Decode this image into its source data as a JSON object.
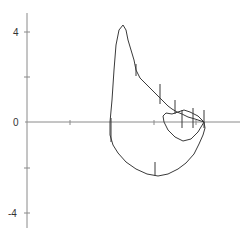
{
  "chart_data": {
    "type": "line",
    "title": "",
    "xlabel": "",
    "ylabel": "",
    "ylim": [
      -5,
      5
    ],
    "y_ticks": [
      4,
      2,
      0,
      -2,
      -4
    ],
    "y_tick_labels": [
      "4",
      "",
      "0",
      "",
      "-4"
    ],
    "x_ticks_visible": true,
    "x_tick_labels": [],
    "grid": false,
    "legend": null,
    "series": [
      {
        "name": "loop-trace",
        "description": "Closed hand-drawn loop: rises steeply to a peak near y=4.3, descends diagonally with small vertical tick marks toward the x-axis, forms a small inner loop just above the axis, then closes through a lower lobe reaching about y=-2.4.",
        "points_px": [
          [
            110,
            122
          ],
          [
            112,
            100
          ],
          [
            114,
            70
          ],
          [
            116,
            45
          ],
          [
            119,
            30
          ],
          [
            123,
            25
          ],
          [
            126,
            30
          ],
          [
            128,
            40
          ],
          [
            131,
            50
          ],
          [
            134,
            60
          ],
          [
            136,
            70
          ],
          [
            140,
            78
          ],
          [
            146,
            84
          ],
          [
            152,
            90
          ],
          [
            158,
            96
          ],
          [
            163,
            101
          ],
          [
            168,
            106
          ],
          [
            172,
            109
          ],
          [
            177,
            112
          ],
          [
            182,
            114
          ],
          [
            188,
            117
          ],
          [
            195,
            119
          ],
          [
            204,
            122
          ],
          [
            205,
            128
          ],
          [
            203,
            135
          ],
          [
            199,
            144
          ],
          [
            194,
            154
          ],
          [
            186,
            163
          ],
          [
            178,
            169
          ],
          [
            168,
            174
          ],
          [
            158,
            176
          ],
          [
            147,
            174
          ],
          [
            136,
            169
          ],
          [
            126,
            162
          ],
          [
            118,
            153
          ],
          [
            113,
            145
          ],
          [
            110,
            135
          ],
          [
            110,
            122
          ]
        ],
        "inner_loop_px": [
          [
            204,
            122
          ],
          [
            198,
            116
          ],
          [
            190,
            112
          ],
          [
            184,
            110
          ],
          [
            178,
            112
          ],
          [
            172,
            114
          ],
          [
            166,
            113
          ],
          [
            163,
            116
          ],
          [
            164,
            122
          ],
          [
            168,
            130
          ],
          [
            175,
            137
          ],
          [
            183,
            141
          ],
          [
            191,
            139
          ],
          [
            198,
            132
          ],
          [
            204,
            122
          ]
        ],
        "tick_marks_px": [
          {
            "x": 136,
            "y1": 64,
            "y2": 76
          },
          {
            "x": 160,
            "y1": 84,
            "y2": 104
          },
          {
            "x": 175,
            "y1": 100,
            "y2": 114
          },
          {
            "x": 182,
            "y1": 110,
            "y2": 128
          },
          {
            "x": 193,
            "y1": 108,
            "y2": 128
          },
          {
            "x": 204,
            "y1": 110,
            "y2": 128
          },
          {
            "x": 155,
            "y1": 162,
            "y2": 176
          },
          {
            "x": 111,
            "y1": 118,
            "y2": 142
          }
        ]
      }
    ]
  },
  "axes": {
    "y_labels": {
      "top": "4",
      "mid": "0",
      "bottom": "-4"
    }
  }
}
